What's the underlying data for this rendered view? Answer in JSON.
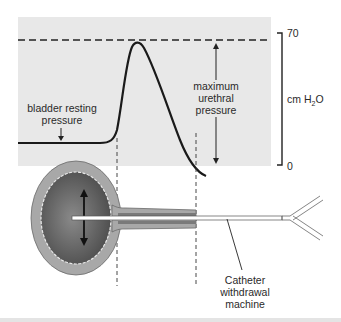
{
  "figure": {
    "panel_color": "#e8e8e8",
    "curve_color": "#1a1a1a",
    "bladder_outer_color": "#a8a8a8",
    "bladder_inner_color": "#5a5a5a",
    "labels": {
      "bladder_resting_line1": "bladder resting",
      "bladder_resting_line2": "pressure",
      "max_urethral_line1": "maximum",
      "max_urethral_line2": "urethral",
      "max_urethral_line3": "pressure",
      "unit_prefix": "cm H",
      "unit_sub": "2",
      "unit_suffix": "O",
      "scale_top": "70",
      "scale_bottom": "0",
      "catheter_line1": "Catheter",
      "catheter_line2": "withdrawal",
      "catheter_line3": "machine"
    },
    "scale": {
      "min": 0,
      "max": 70,
      "unit": "cm H2O"
    }
  }
}
